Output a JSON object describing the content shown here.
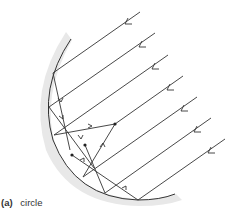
{
  "figure": {
    "caption_tag": "(a)",
    "caption_text": "circle",
    "colors": {
      "line": "#333333",
      "mirror_shadow": "#e6e6e6",
      "background": "#ffffff"
    },
    "incident_ray_count": 7,
    "focal_points_marked": 3
  }
}
